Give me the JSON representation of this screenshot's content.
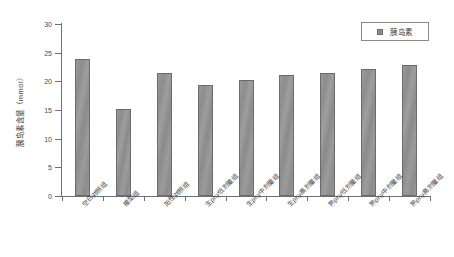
{
  "chart_data": {
    "type": "bar",
    "title": "",
    "subtitle": "",
    "xlabel": "",
    "ylabel": "胰岛素含量（mmol）",
    "ylim": [
      0,
      30
    ],
    "ytick_labels": [
      "0",
      "5",
      "10",
      "15",
      "20",
      "25",
      "30"
    ],
    "ytick_values": [
      0,
      5,
      10,
      15,
      20,
      25,
      30
    ],
    "grid": false,
    "legend_position": "top-right",
    "legend": [
      "胰岛素"
    ],
    "bar_color": "#8d8d8d",
    "bar_edge_color": "#6b6b6b",
    "axis_color": "#6f6f6f",
    "categories": [
      "空白对照组",
      "模型组",
      "阳性对照组",
      "生phy低剂量组",
      "生phy中剂量组",
      "生phy高剂量组",
      "熟phy低剂量组",
      "熟phy中剂量组",
      "熟phy高剂量组"
    ],
    "series": [
      {
        "name": "胰岛素",
        "values": [
          23.9,
          15.2,
          21.5,
          19.4,
          20.2,
          21.1,
          21.4,
          22.2,
          22.9
        ]
      }
    ]
  },
  "legend": {
    "swatch_name": "legend-color-swatch",
    "label": "胰岛素"
  }
}
